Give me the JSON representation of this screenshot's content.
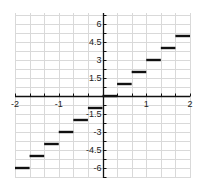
{
  "chart_data": {
    "type": "line",
    "title": "",
    "subtitle": "",
    "xlabel": "",
    "ylabel": "",
    "function": "y = floor(3x) (step / greatest integer function)",
    "xlim": [
      -2,
      2
    ],
    "ylim": [
      -6.9,
      6.9
    ],
    "grid": true,
    "legend": null,
    "x_ticks": [
      -2,
      -1,
      1,
      2
    ],
    "x_tick_labels": [
      "-2",
      "-1",
      "1",
      "2"
    ],
    "y_ticks": [
      6,
      4.5,
      3,
      1.5,
      -1.5,
      -3,
      -4.5,
      -6
    ],
    "y_tick_labels": [
      "6",
      "4.5",
      "3",
      "1.5",
      "-1.5",
      "-3",
      "-4.5",
      "-6"
    ],
    "x_minor_step": 0.3333,
    "y_minor_step": 0.75,
    "series": [
      {
        "name": "steps",
        "color": "#111111",
        "segments": [
          {
            "x_start": -2.0,
            "x_end": -1.6667,
            "y": -6
          },
          {
            "x_start": -1.6667,
            "x_end": -1.3333,
            "y": -5
          },
          {
            "x_start": -1.3333,
            "x_end": -1.0,
            "y": -4
          },
          {
            "x_start": -1.0,
            "x_end": -0.6667,
            "y": -3
          },
          {
            "x_start": -0.6667,
            "x_end": -0.3333,
            "y": -2
          },
          {
            "x_start": -0.3333,
            "x_end": 0.0,
            "y": -1
          },
          {
            "x_start": 0.0,
            "x_end": 0.3333,
            "y": 0
          },
          {
            "x_start": 0.3333,
            "x_end": 0.6667,
            "y": 1
          },
          {
            "x_start": 0.6667,
            "x_end": 1.0,
            "y": 2
          },
          {
            "x_start": 1.0,
            "x_end": 1.3333,
            "y": 3
          },
          {
            "x_start": 1.3333,
            "x_end": 1.6667,
            "y": 4
          },
          {
            "x_start": 1.6667,
            "x_end": 2.0,
            "y": 5
          }
        ]
      }
    ]
  },
  "colors": {
    "grid": "#d9d9d9",
    "axis": "#111111",
    "step": "#111111"
  }
}
